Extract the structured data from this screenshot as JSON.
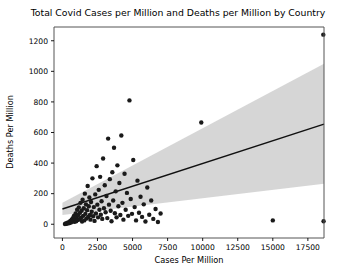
{
  "chart_data": {
    "type": "scatter",
    "title": "Total Covid Cases per Million and Deaths per Million by Country",
    "xlabel": "Cases Per Million",
    "ylabel": "Deaths Per Million",
    "xlim": [
      -600,
      18650
    ],
    "ylim": [
      -90,
      1290
    ],
    "xticks": [
      0,
      2500,
      5000,
      7500,
      10000,
      12500,
      15000,
      17500
    ],
    "xtick_labels": [
      "0",
      "2500",
      "5000",
      "7500",
      "10000",
      "12500",
      "15000",
      "17500"
    ],
    "yticks": [
      0,
      200,
      400,
      600,
      800,
      1000,
      1200
    ],
    "ytick_labels": [
      "0",
      "200",
      "400",
      "600",
      "800",
      "1000",
      "1200"
    ],
    "grid": false,
    "legend": null,
    "marker_color": "#1a1a1a",
    "marker_size": 4.4,
    "regression": {
      "name": "linear fit",
      "color": "#111111",
      "x": [
        0,
        18650
      ],
      "y": [
        100,
        655
      ],
      "slope": 0.02976,
      "intercept": 100
    },
    "confidence_band": {
      "name": "95% confidence interval",
      "color": "#c8c8c8",
      "opacity": 0.75,
      "x": [
        0,
        18650
      ],
      "upper": [
        140,
        1050
      ],
      "lower": [
        60,
        265
      ]
    },
    "series": [
      {
        "name": "Countries",
        "points": [
          [
            180,
            2
          ],
          [
            240,
            5
          ],
          [
            300,
            3
          ],
          [
            360,
            10
          ],
          [
            420,
            6
          ],
          [
            470,
            14
          ],
          [
            520,
            8
          ],
          [
            560,
            22
          ],
          [
            610,
            12
          ],
          [
            660,
            30
          ],
          [
            700,
            18
          ],
          [
            740,
            40
          ],
          [
            780,
            25
          ],
          [
            820,
            55
          ],
          [
            860,
            16
          ],
          [
            900,
            35
          ],
          [
            940,
            70
          ],
          [
            980,
            20
          ],
          [
            1010,
            48
          ],
          [
            1050,
            95
          ],
          [
            1090,
            28
          ],
          [
            1130,
            60
          ],
          [
            1170,
            110
          ],
          [
            1210,
            33
          ],
          [
            1250,
            75
          ],
          [
            1290,
            140
          ],
          [
            1330,
            42
          ],
          [
            1370,
            88
          ],
          [
            1400,
            18
          ],
          [
            1440,
            160
          ],
          [
            1480,
            55
          ],
          [
            1520,
            105
          ],
          [
            1560,
            25
          ],
          [
            1600,
            200
          ],
          [
            1640,
            68
          ],
          [
            1680,
            130
          ],
          [
            1720,
            38
          ],
          [
            1760,
            92
          ],
          [
            1800,
            250
          ],
          [
            1840,
            48
          ],
          [
            1880,
            118
          ],
          [
            1920,
            175
          ],
          [
            1960,
            60
          ],
          [
            2000,
            30
          ],
          [
            2040,
            145
          ],
          [
            2090,
            82
          ],
          [
            2140,
            300
          ],
          [
            2190,
            52
          ],
          [
            2240,
            112
          ],
          [
            2290,
            22
          ],
          [
            2340,
            195
          ],
          [
            2390,
            70
          ],
          [
            2440,
            380
          ],
          [
            2490,
            128
          ],
          [
            2540,
            45
          ],
          [
            2590,
            225
          ],
          [
            2640,
            95
          ],
          [
            2690,
            310
          ],
          [
            2740,
            62
          ],
          [
            2790,
            150
          ],
          [
            2840,
            35
          ],
          [
            2900,
            430
          ],
          [
            2960,
            105
          ],
          [
            3020,
            255
          ],
          [
            3080,
            78
          ],
          [
            3140,
            185
          ],
          [
            3200,
            40
          ],
          [
            3260,
            560
          ],
          [
            3320,
            128
          ],
          [
            3380,
            295
          ],
          [
            3440,
            88
          ],
          [
            3500,
            20
          ],
          [
            3560,
            340
          ],
          [
            3620,
            155
          ],
          [
            3680,
            500
          ],
          [
            3740,
            72
          ],
          [
            3800,
            215
          ],
          [
            3860,
            45
          ],
          [
            3920,
            385
          ],
          [
            3990,
            118
          ],
          [
            4060,
            270
          ],
          [
            4130,
            60
          ],
          [
            4200,
            580
          ],
          [
            4280,
            140
          ],
          [
            4350,
            30
          ],
          [
            4430,
            330
          ],
          [
            4510,
            95
          ],
          [
            4600,
            205
          ],
          [
            4690,
            55
          ],
          [
            4780,
            810
          ],
          [
            4870,
            165
          ],
          [
            4960,
            68
          ],
          [
            5050,
            420
          ],
          [
            5150,
            112
          ],
          [
            5250,
            25
          ],
          [
            5350,
            285
          ],
          [
            5460,
            75
          ],
          [
            5570,
            180
          ],
          [
            5680,
            48
          ],
          [
            5800,
            130
          ],
          [
            5920,
            18
          ],
          [
            6050,
            240
          ],
          [
            6190,
            62
          ],
          [
            6330,
            155
          ],
          [
            6480,
            35
          ],
          [
            6640,
            100
          ],
          [
            6810,
            15
          ],
          [
            7000,
            70
          ],
          [
            9900,
            665
          ],
          [
            15000,
            25
          ],
          [
            18600,
            1240
          ],
          [
            18620,
            20
          ]
        ]
      }
    ]
  },
  "axes": {
    "tick_color": "#000000",
    "spine_color": "#555555"
  }
}
